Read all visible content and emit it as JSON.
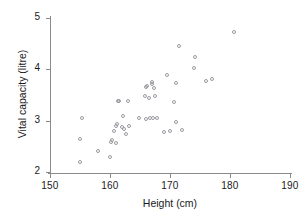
{
  "chart_data": {
    "type": "scatter",
    "title": "",
    "xlabel": "Height (cm)",
    "ylabel": "Vital capacity (litre)",
    "xlim": [
      150,
      190
    ],
    "ylim": [
      2,
      5
    ],
    "xticks": [
      150,
      160,
      170,
      180,
      190
    ],
    "yticks": [
      2,
      3,
      4,
      5
    ],
    "grid": false,
    "legend": null,
    "marker": "open-circle",
    "marker_color": "#9a9aa2",
    "points": [
      {
        "x": 155.0,
        "y": 2.19
      },
      {
        "x": 155.0,
        "y": 2.64
      },
      {
        "x": 155.3,
        "y": 3.05
      },
      {
        "x": 158.0,
        "y": 2.4
      },
      {
        "x": 160.0,
        "y": 2.3
      },
      {
        "x": 160.2,
        "y": 2.58
      },
      {
        "x": 160.3,
        "y": 2.62
      },
      {
        "x": 160.6,
        "y": 2.8
      },
      {
        "x": 161.0,
        "y": 2.56
      },
      {
        "x": 161.0,
        "y": 2.9
      },
      {
        "x": 161.2,
        "y": 2.94
      },
      {
        "x": 161.3,
        "y": 3.38
      },
      {
        "x": 161.5,
        "y": 3.38
      },
      {
        "x": 162.0,
        "y": 2.87
      },
      {
        "x": 162.2,
        "y": 3.1
      },
      {
        "x": 162.4,
        "y": 2.84
      },
      {
        "x": 162.6,
        "y": 2.75
      },
      {
        "x": 163.0,
        "y": 3.38
      },
      {
        "x": 163.2,
        "y": 2.9
      },
      {
        "x": 164.8,
        "y": 3.06
      },
      {
        "x": 165.8,
        "y": 3.48
      },
      {
        "x": 166.0,
        "y": 3.66
      },
      {
        "x": 166.0,
        "y": 3.04
      },
      {
        "x": 166.2,
        "y": 3.68
      },
      {
        "x": 166.5,
        "y": 3.44
      },
      {
        "x": 166.7,
        "y": 3.05
      },
      {
        "x": 167.0,
        "y": 3.72
      },
      {
        "x": 167.0,
        "y": 3.76
      },
      {
        "x": 167.2,
        "y": 3.05
      },
      {
        "x": 167.4,
        "y": 3.64
      },
      {
        "x": 167.5,
        "y": 3.48
      },
      {
        "x": 167.8,
        "y": 3.05
      },
      {
        "x": 169.0,
        "y": 2.78
      },
      {
        "x": 169.5,
        "y": 3.88
      },
      {
        "x": 170.0,
        "y": 2.79
      },
      {
        "x": 170.6,
        "y": 3.36
      },
      {
        "x": 171.0,
        "y": 3.74
      },
      {
        "x": 171.0,
        "y": 2.98
      },
      {
        "x": 171.5,
        "y": 4.45
      },
      {
        "x": 172.0,
        "y": 2.82
      },
      {
        "x": 174.0,
        "y": 4.02
      },
      {
        "x": 174.2,
        "y": 4.25
      },
      {
        "x": 176.0,
        "y": 3.78
      },
      {
        "x": 177.0,
        "y": 3.81
      },
      {
        "x": 180.6,
        "y": 4.72
      }
    ]
  },
  "axes": {
    "x_title": "Height (cm)",
    "y_title": "Vital capacity (litre)",
    "x_ticklabels": [
      "150",
      "160",
      "170",
      "180",
      "190"
    ],
    "y_ticklabels": [
      "5",
      "4",
      "3",
      "2"
    ]
  }
}
